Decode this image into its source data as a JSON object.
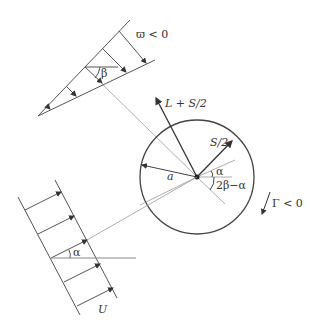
{
  "labels": {
    "omega": "ϖ < 0",
    "beta": "β",
    "lift": "L + S/2",
    "s_half": "S/2",
    "alpha_center": "α",
    "two_beta_alpha": "2β−α",
    "radius": "a",
    "gamma": "Γ < 0",
    "alpha_flow": "α",
    "velocity": "U"
  },
  "colors": {
    "stroke": "#444444",
    "thin": "#888888"
  }
}
